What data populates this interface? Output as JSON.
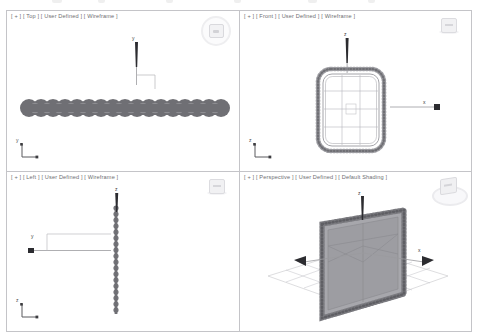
{
  "app": {
    "title": "3D Modeling Viewports",
    "background_color": "#ffffff",
    "border_color": "#c4c4c8",
    "label_color": "#6e6e72",
    "object_color": "#6f6f74",
    "grid_color": "#bdbdc2"
  },
  "toolbar": {
    "visible_fragment": true,
    "note": "partially cut-off toolbar row at top edge",
    "items": [
      {
        "label": "",
        "x": 54
      },
      {
        "label": "",
        "x": 100
      },
      {
        "label": "",
        "x": 168
      },
      {
        "label": "",
        "x": 236
      },
      {
        "label": "",
        "x": 310
      },
      {
        "label": "",
        "x": 370
      }
    ]
  },
  "viewports": [
    {
      "id": "top",
      "label": "[ + ] [ Top ] [ User Defined ] [ Wireframe ]",
      "view_name": "Top",
      "shading": "Wireframe",
      "user_defined": "User Defined",
      "nav_widget": "steering-wheel-circle",
      "axis_labels": {
        "vertical": "y",
        "horizontal": "x"
      },
      "gizmo_axes": [
        "y",
        "x"
      ],
      "object": "beaded-strip-horizontal",
      "bump_count": 17
    },
    {
      "id": "front",
      "label": "[ + ] [ Front ] [ User Defined ] [ Wireframe ]",
      "view_name": "Front",
      "shading": "Wireframe",
      "user_defined": "User Defined",
      "nav_widget": "view-cube",
      "axis_labels": {
        "vertical": "z",
        "horizontal": "x"
      },
      "gizmo_axes": [
        "z",
        "x"
      ],
      "object": "beaded-rounded-rect-grid",
      "grid_rows": 4,
      "grid_cols": 3
    },
    {
      "id": "left",
      "label": "[ + ] [ Left ] [ User Defined ] [ Wireframe ]",
      "view_name": "Left",
      "shading": "Wireframe",
      "user_defined": "User Defined",
      "nav_widget": "view-cube",
      "axis_labels": {
        "vertical": "z",
        "horizontal": "y"
      },
      "gizmo_axes": [
        "z",
        "y"
      ],
      "object": "beaded-strip-vertical",
      "bump_count": 21
    },
    {
      "id": "perspective",
      "label": "[ + ] [ Perspective ] [ User Defined ] [ Default Shading ]",
      "view_name": "Perspective",
      "shading": "Default Shading",
      "user_defined": "User Defined",
      "nav_widget": "view-cube-compass",
      "axis_labels": {
        "vertical": "z",
        "horizontal": "x"
      },
      "gizmo_axes": [
        "z",
        "x"
      ],
      "object": "beaded-panel-3d-on-grid",
      "ground_grid": true
    }
  ]
}
